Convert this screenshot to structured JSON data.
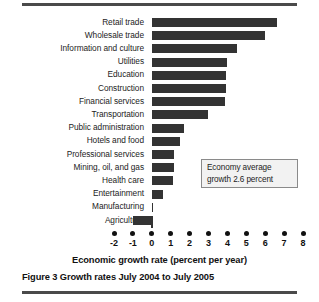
{
  "figure": {
    "caption": "Figure 3 Growth rates July 2004 to July 2005",
    "axis_title": "Economic growth rate (percent per year)",
    "annotation": {
      "line1": "Economy average",
      "line2": "growth 2.6 percent"
    }
  },
  "colors": {
    "bar": "#333333",
    "rule": "#4a4a4a",
    "callout_bg": "#f2f2f2",
    "callout_border": "#8a8a8a",
    "text": "#1c1c1c"
  },
  "chart_data": {
    "type": "bar",
    "orientation": "horizontal",
    "title": "Figure 3 Growth rates July 2004 to July 2005",
    "xlabel": "Economic growth rate (percent per year)",
    "ylabel": "",
    "xlim": [
      -2,
      8
    ],
    "xticks": [
      -2,
      -1,
      0,
      1,
      2,
      3,
      4,
      5,
      6,
      7,
      8
    ],
    "xticklabels": [
      "-2",
      "-1",
      "0",
      "1",
      "2",
      "3",
      "4",
      "5",
      "6",
      "7",
      "8"
    ],
    "grid": false,
    "legend": null,
    "categories": [
      "Retail trade",
      "Wholesale trade",
      "Information and culture",
      "Utilities",
      "Education",
      "Construction",
      "Financial services",
      "Transportation",
      "Public administration",
      "Hotels and food",
      "Professional services",
      "Mining, oil, and gas",
      "Health care",
      "Entertainment",
      "Manufacturing",
      "Agriculture"
    ],
    "values": [
      6.6,
      6.0,
      4.5,
      4.0,
      3.9,
      3.9,
      3.85,
      3.0,
      1.7,
      1.5,
      1.2,
      1.2,
      1.1,
      0.6,
      0.05,
      -1.0
    ],
    "annotations": [
      {
        "text": "Economy average growth 2.6 percent",
        "value": 2.6
      }
    ]
  }
}
